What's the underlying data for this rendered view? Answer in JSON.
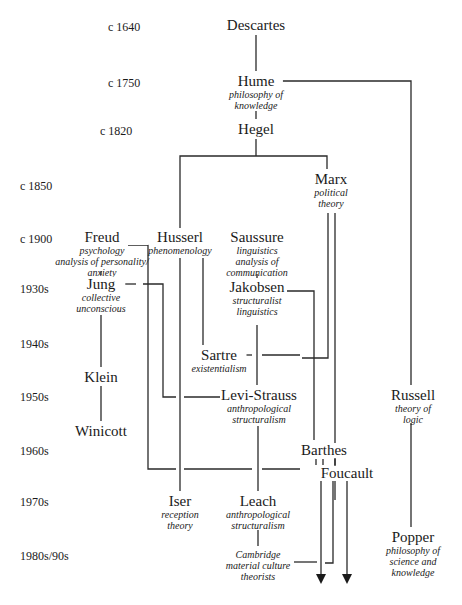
{
  "eras": [
    {
      "label": "c 1640",
      "x": 108,
      "y": 20
    },
    {
      "label": "c 1750",
      "x": 108,
      "y": 76
    },
    {
      "label": "c 1820",
      "x": 100,
      "y": 124
    },
    {
      "label": "c 1850",
      "x": 20,
      "y": 179
    },
    {
      "label": "c 1900",
      "x": 20,
      "y": 232
    },
    {
      "label": "1930s",
      "x": 20,
      "y": 282
    },
    {
      "label": "1940s",
      "x": 20,
      "y": 337
    },
    {
      "label": "1950s",
      "x": 20,
      "y": 390
    },
    {
      "label": "1960s",
      "x": 20,
      "y": 444
    },
    {
      "label": "1970s",
      "x": 20,
      "y": 495
    },
    {
      "label": "1980s/90s",
      "x": 20,
      "y": 549
    }
  ],
  "nodes": [
    {
      "id": "descartes",
      "name": "Descartes",
      "desc": [],
      "x": 256,
      "y": 18
    },
    {
      "id": "hume",
      "name": "Hume",
      "desc": [
        "philosophy of",
        "knowledge"
      ],
      "x": 256,
      "y": 74
    },
    {
      "id": "hegel",
      "name": "Hegel",
      "desc": [],
      "x": 256,
      "y": 122
    },
    {
      "id": "marx",
      "name": "Marx",
      "desc": [
        "political",
        "theory"
      ],
      "x": 331,
      "y": 172
    },
    {
      "id": "freud",
      "name": "Freud",
      "desc": [
        "psychology",
        "analysis of personality/",
        "anxiety"
      ],
      "x": 102,
      "y": 230
    },
    {
      "id": "husserl",
      "name": "Husserl",
      "desc": [
        "phenomenology"
      ],
      "x": 180,
      "y": 230
    },
    {
      "id": "saussure",
      "name": "Saussure",
      "desc": [
        "linguistics",
        "analysis of",
        "communication"
      ],
      "x": 257,
      "y": 230
    },
    {
      "id": "jung",
      "name": "Jung",
      "desc": [
        "collective",
        "unconscious"
      ],
      "x": 101,
      "y": 277
    },
    {
      "id": "jakobsen",
      "name": "Jakobsen",
      "desc": [
        "structuralist",
        "linguistics"
      ],
      "x": 257,
      "y": 280
    },
    {
      "id": "sartre",
      "name": "Sartre",
      "desc": [
        "existentialism"
      ],
      "x": 219,
      "y": 348
    },
    {
      "id": "klein",
      "name": "Klein",
      "desc": [],
      "x": 101,
      "y": 370
    },
    {
      "id": "levi_strauss",
      "name": "Levi-Strauss",
      "desc": [
        "anthropological",
        "structuralism"
      ],
      "x": 259,
      "y": 388
    },
    {
      "id": "russell",
      "name": "Russell",
      "desc": [
        "theory of",
        "logic"
      ],
      "x": 413,
      "y": 388
    },
    {
      "id": "winicott",
      "name": "Winicott",
      "desc": [],
      "x": 101,
      "y": 424
    },
    {
      "id": "barthes",
      "name": "Barthes",
      "desc": [],
      "x": 324,
      "y": 443
    },
    {
      "id": "foucault",
      "name": "Foucault",
      "desc": [],
      "x": 347,
      "y": 466
    },
    {
      "id": "iser",
      "name": "Iser",
      "desc": [
        "reception",
        "theory"
      ],
      "x": 180,
      "y": 494
    },
    {
      "id": "leach",
      "name": "Leach",
      "desc": [
        "anthropological",
        "structuralism"
      ],
      "x": 258,
      "y": 494
    },
    {
      "id": "popper",
      "name": "Popper",
      "desc": [
        "philosophy of",
        "science and",
        "knowledge"
      ],
      "x": 413,
      "y": 530
    },
    {
      "id": "cambridge",
      "name": "",
      "desc": [
        "Cambridge",
        "material culture",
        "theorists"
      ],
      "x": 258,
      "y": 549
    }
  ],
  "colors": {
    "line": "#2a2a2a",
    "text": "#1a1a1a",
    "background": "#ffffff"
  }
}
